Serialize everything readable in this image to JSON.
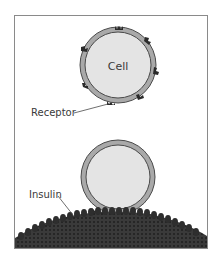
{
  "diagram": {
    "labels": {
      "cell": "Cell",
      "receptor": "Receptor",
      "insulin": "Insulin"
    },
    "colors": {
      "frame": "#8a8a8a",
      "cell_fill": "#e4e4e4",
      "membrane": "#a9a9a9",
      "membrane_line": "#4a4a4a",
      "receptor": "#2a2a2a",
      "surface": "#333333",
      "text": "#3a3a3a"
    }
  }
}
